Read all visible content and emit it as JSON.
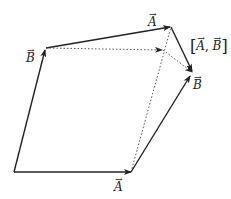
{
  "diagram": {
    "labels": {
      "a_bottom": "A",
      "b_left": "B",
      "a_top": "A",
      "b_right": "B",
      "commutator_open": "[",
      "commutator_a": "A",
      "commutator_sep": ", ",
      "commutator_b": "B",
      "commutator_close": "]"
    },
    "points": {
      "origin": [
        14,
        172
      ],
      "a_end": [
        131,
        172
      ],
      "b_end": [
        46,
        48
      ],
      "ab_end": [
        171,
        27
      ],
      "ba_end": [
        191,
        75
      ],
      "para_corner": [
        163,
        50
      ]
    },
    "colors": {
      "stroke": "#222222",
      "dotted": "#444444"
    }
  }
}
